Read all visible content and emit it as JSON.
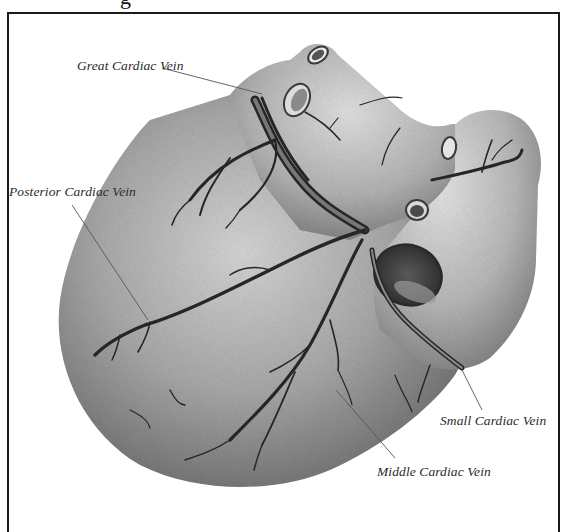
{
  "figure": {
    "heading_fragment": "g",
    "frame_color": "#1a1a1a",
    "style": "grayscale engraving"
  },
  "labels": [
    {
      "id": "great",
      "text": "Great Cardiac Vein",
      "x": 77,
      "y": 58,
      "pointer_to": [
        268,
        92
      ]
    },
    {
      "id": "posterior",
      "text": "Posterior Cardiac Vein",
      "x": 9,
      "y": 184,
      "pointer_to": [
        148,
        320
      ]
    },
    {
      "id": "small",
      "text": "Small Cardiac Vein",
      "x": 440,
      "y": 413,
      "pointer_to": [
        462,
        370
      ]
    },
    {
      "id": "middle",
      "text": "Middle Cardiac Vein",
      "x": 377,
      "y": 464,
      "pointer_to": [
        362,
        447
      ]
    }
  ],
  "colors": {
    "background": "#ffffff",
    "heart_light": "#c9c9c9",
    "heart_mid": "#9a9a9a",
    "heart_dark": "#5e5e5e",
    "vein": "#262626",
    "label_text": "#2a2a2a",
    "leader_line": "#555555"
  }
}
